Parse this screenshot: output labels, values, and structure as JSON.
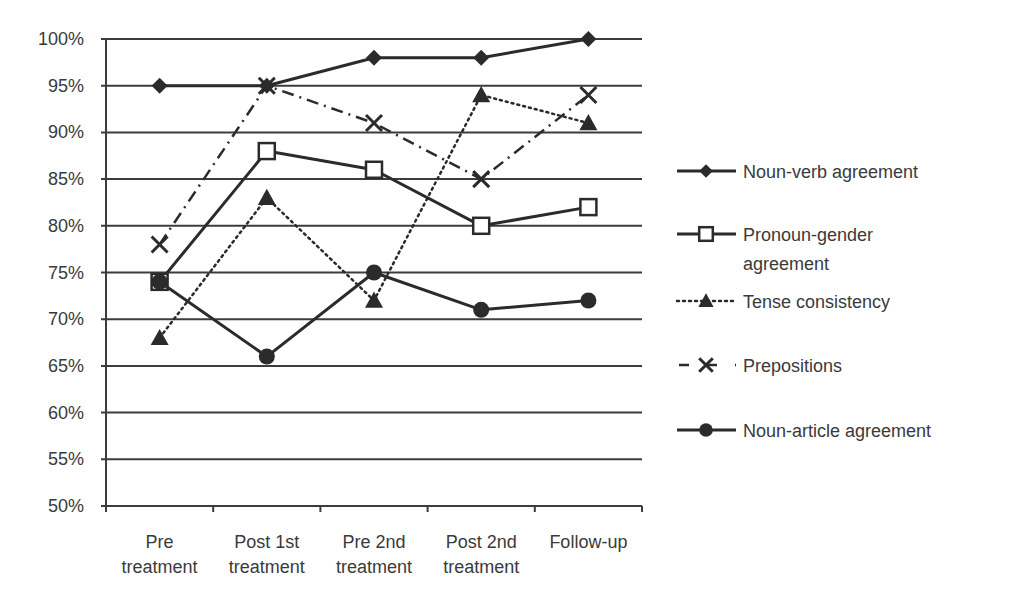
{
  "chart_data": {
    "type": "line",
    "title": "",
    "xlabel": "",
    "ylabel": "",
    "ylim": [
      50,
      100
    ],
    "y_ticks": [
      "50%",
      "55%",
      "60%",
      "65%",
      "70%",
      "75%",
      "80%",
      "85%",
      "90%",
      "95%",
      "100%"
    ],
    "grid": true,
    "legend_position": "right",
    "categories": [
      [
        "Pre",
        "treatment"
      ],
      [
        "Post 1st",
        "treatment"
      ],
      [
        "Pre 2nd",
        "treatment"
      ],
      [
        "Post 2nd",
        "treatment"
      ],
      [
        "Follow-up"
      ]
    ],
    "series": [
      {
        "name": "Noun-verb agreement",
        "legend_lines": [
          "Noun-verb agreement"
        ],
        "values": [
          95,
          95,
          98,
          98,
          100
        ],
        "marker": "diamond",
        "line": "solid"
      },
      {
        "name": "Pronoun-gender agreement",
        "legend_lines": [
          "Pronoun-gender",
          "agreement"
        ],
        "values": [
          74,
          88,
          86,
          80,
          82
        ],
        "marker": "square-open",
        "line": "solid"
      },
      {
        "name": "Tense consistency",
        "legend_lines": [
          "Tense consistency"
        ],
        "values": [
          68,
          83,
          72,
          94,
          91
        ],
        "marker": "triangle",
        "line": "dotted"
      },
      {
        "name": "Prepositions",
        "legend_lines": [
          "Prepositions"
        ],
        "values": [
          78,
          95,
          91,
          85,
          94
        ],
        "marker": "x",
        "line": "dash-dot"
      },
      {
        "name": "Noun-article agreement",
        "legend_lines": [
          "Noun-article agreement"
        ],
        "values": [
          74,
          66,
          75,
          71,
          72
        ],
        "marker": "circle",
        "line": "solid"
      }
    ],
    "colors": {
      "line": "#2b2b2b",
      "grid": "#3c3c3c",
      "text": "#3a3a3a",
      "background": "#ffffff"
    }
  }
}
